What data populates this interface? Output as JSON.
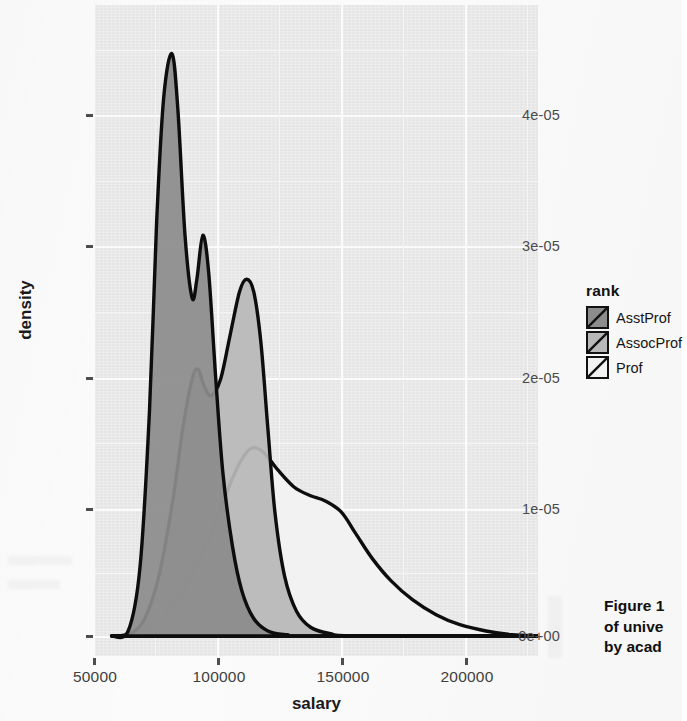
{
  "figure": {
    "axes": {
      "x_label": "salary",
      "y_label": "density",
      "x_ticks": [
        "50000",
        "100000",
        "150000",
        "200000"
      ],
      "y_ticks": [
        "0e+00",
        "1e-05",
        "2e-05",
        "3e-05",
        "4e-05"
      ]
    },
    "legend": {
      "title": "rank",
      "items": [
        {
          "label": "AsstProf",
          "color": "#8c8c8c"
        },
        {
          "label": "AssocProf",
          "color": "#b8b8b8"
        },
        {
          "label": "Prof",
          "color": "#f2f2f2"
        }
      ]
    },
    "caption": {
      "line1": "Figure 1",
      "line2": "of unive",
      "line3": "by acad"
    }
  },
  "chart_data": {
    "type": "area",
    "title": "",
    "xlabel": "salary",
    "ylabel": "density",
    "xlim": [
      43000,
      230000
    ],
    "ylim": [
      0,
      5e-05
    ],
    "xticks": [
      50000,
      100000,
      150000,
      200000
    ],
    "yticks": [
      0,
      1e-05,
      2e-05,
      3e-05,
      4e-05
    ],
    "grid": true,
    "legend_position": "right",
    "legend_title": "rank",
    "series": [
      {
        "name": "AsstProf",
        "color": "#8c8c8c",
        "points": [
          [
            50000,
            0.0
          ],
          [
            57000,
            4e-07
          ],
          [
            62000,
            5.5e-06
          ],
          [
            66000,
            1.8e-05
          ],
          [
            69000,
            3.3e-05
          ],
          [
            72000,
            4.3e-05
          ],
          [
            75500,
            4.65e-05
          ],
          [
            78000,
            4.2e-05
          ],
          [
            81000,
            3.2e-05
          ],
          [
            84000,
            2.7e-05
          ],
          [
            86000,
            2.85e-05
          ],
          [
            88500,
            3.2e-05
          ],
          [
            91000,
            2.9e-05
          ],
          [
            94000,
            2.05e-05
          ],
          [
            97000,
            1.3e-05
          ],
          [
            101000,
            7.2e-06
          ],
          [
            105000,
            3.6e-06
          ],
          [
            110000,
            1.4e-06
          ],
          [
            116000,
            4e-07
          ],
          [
            124000,
            1e-07
          ],
          [
            135000,
            0.0
          ],
          [
            230000,
            0.0
          ]
        ]
      },
      {
        "name": "AssocProf",
        "color": "#b8b8b8",
        "points": [
          [
            50000,
            0.0
          ],
          [
            58000,
            2e-07
          ],
          [
            64000,
            1.4e-06
          ],
          [
            70000,
            4.8e-06
          ],
          [
            76000,
            1.1e-05
          ],
          [
            80000,
            1.65e-05
          ],
          [
            84000,
            2.05e-05
          ],
          [
            86500,
            2.13e-05
          ],
          [
            89000,
            2e-05
          ],
          [
            92000,
            1.92e-05
          ],
          [
            96000,
            2.05e-05
          ],
          [
            100000,
            2.4e-05
          ],
          [
            104000,
            2.75e-05
          ],
          [
            107000,
            2.85e-05
          ],
          [
            110000,
            2.75e-05
          ],
          [
            113000,
            2.35e-05
          ],
          [
            116000,
            1.65e-05
          ],
          [
            119000,
            9.8e-06
          ],
          [
            123000,
            4.8e-06
          ],
          [
            128000,
            2e-06
          ],
          [
            134000,
            7e-07
          ],
          [
            142000,
            2e-07
          ],
          [
            155000,
            0.0
          ],
          [
            230000,
            0.0
          ]
        ]
      },
      {
        "name": "Prof",
        "color": "#f2f2f2",
        "points": [
          [
            50000,
            0.0
          ],
          [
            60000,
            2e-07
          ],
          [
            70000,
            1.2e-06
          ],
          [
            78000,
            3e-06
          ],
          [
            85000,
            5.3e-06
          ],
          [
            92000,
            8.2e-06
          ],
          [
            98000,
            1.12e-05
          ],
          [
            104000,
            1.38e-05
          ],
          [
            109000,
            1.5e-05
          ],
          [
            114000,
            1.47e-05
          ],
          [
            120000,
            1.33e-05
          ],
          [
            127000,
            1.19e-05
          ],
          [
            134000,
            1.12e-05
          ],
          [
            140000,
            1.08e-05
          ],
          [
            147000,
            9.9e-06
          ],
          [
            153000,
            8.2e-06
          ],
          [
            160000,
            6.2e-06
          ],
          [
            168000,
            4.4e-06
          ],
          [
            177000,
            2.9e-06
          ],
          [
            187000,
            1.7e-06
          ],
          [
            197000,
            9e-07
          ],
          [
            208000,
            4e-07
          ],
          [
            219000,
            1e-07
          ],
          [
            230000,
            0.0
          ]
        ]
      }
    ]
  }
}
